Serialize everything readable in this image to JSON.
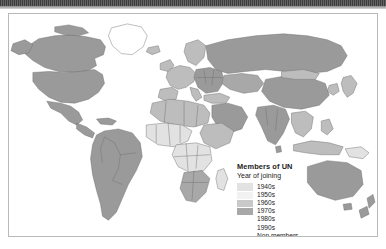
{
  "map": {
    "title": "World map of UN membership",
    "projection": "world",
    "ocean_color": "#ffffff",
    "border_color": "#6e6e6e",
    "frame_color": "#b9b9b9"
  },
  "legend": {
    "title": "Members of UN",
    "subtitle": "Year of joining",
    "entries": [
      {
        "label": "1940s",
        "color": "#9a9a9a"
      },
      {
        "label": "1950s",
        "color": "#bdbdbd"
      },
      {
        "label": "1960s",
        "color": "#e2e2e2"
      },
      {
        "label": "1970s",
        "color": "#f2f2f2"
      },
      {
        "label": "1980s",
        "color": "#c9c9c9"
      },
      {
        "label": "1990s",
        "color": "#a8a8a8"
      },
      {
        "label": "Non members",
        "color": "none"
      }
    ]
  },
  "regions": [
    {
      "name": "canada",
      "decade": "1940s",
      "color": "#9a9a9a"
    },
    {
      "name": "united-states",
      "decade": "1940s",
      "color": "#9a9a9a"
    },
    {
      "name": "mexico",
      "decade": "1940s",
      "color": "#9a9a9a"
    },
    {
      "name": "central-america",
      "decade": "1940s",
      "color": "#9a9a9a"
    },
    {
      "name": "greenland",
      "decade": "Non members",
      "color": "#ffffff"
    },
    {
      "name": "south-america",
      "decade": "1940s",
      "color": "#9a9a9a"
    },
    {
      "name": "north-africa",
      "decade": "1950s",
      "color": "#bdbdbd"
    },
    {
      "name": "sub-saharan-africa",
      "decade": "1960s",
      "color": "#e2e2e2"
    },
    {
      "name": "southern-africa",
      "decade": "1990s",
      "color": "#a8a8a8"
    },
    {
      "name": "western-europe",
      "decade": "1950s",
      "color": "#bdbdbd"
    },
    {
      "name": "eastern-europe",
      "decade": "1940s",
      "color": "#9a9a9a"
    },
    {
      "name": "russia",
      "decade": "1940s",
      "color": "#9a9a9a"
    },
    {
      "name": "central-asia",
      "decade": "1990s",
      "color": "#a8a8a8"
    },
    {
      "name": "middle-east",
      "decade": "1940s",
      "color": "#9a9a9a"
    },
    {
      "name": "south-asia",
      "decade": "1940s",
      "color": "#9a9a9a"
    },
    {
      "name": "china",
      "decade": "1940s",
      "color": "#9a9a9a"
    },
    {
      "name": "southeast-asia",
      "decade": "1950s",
      "color": "#bdbdbd"
    },
    {
      "name": "japan",
      "decade": "1950s",
      "color": "#bdbdbd"
    },
    {
      "name": "australia",
      "decade": "1940s",
      "color": "#9a9a9a"
    },
    {
      "name": "new-zealand",
      "decade": "1940s",
      "color": "#9a9a9a"
    },
    {
      "name": "antarctica",
      "decade": "Non members",
      "color": "#ffffff"
    }
  ]
}
